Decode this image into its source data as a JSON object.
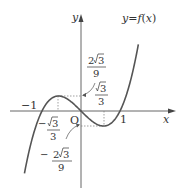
{
  "figure": {
    "function_label": "y=f(x)",
    "function_label_parts": {
      "y": "y",
      "eq": "=",
      "f": "f",
      "paren_open": "(",
      "x": "x",
      "paren_close": ")"
    },
    "axis_x_label": "x",
    "axis_y_label": "y",
    "origin_label": "O",
    "tick_neg1": "−1",
    "tick_1": "1",
    "max_value": {
      "num_coef": "2",
      "radical": "3",
      "den": "9"
    },
    "min_x": {
      "radical": "3",
      "den": "3"
    },
    "max_x": {
      "sign": "−",
      "radical": "3",
      "den": "3"
    },
    "min_value": {
      "sign": "−",
      "num_coef": "2",
      "radical": "3",
      "den": "9"
    },
    "colors": {
      "curve": "#555555",
      "axis": "#555555",
      "text": "#333333",
      "dotted": "#777777"
    }
  }
}
